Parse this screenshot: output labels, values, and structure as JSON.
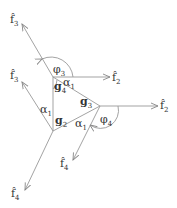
{
  "diagram": {
    "type": "force-vector diagram",
    "line_color": "#888888",
    "text_color": "#333333",
    "nodes": [
      {
        "id": "g4",
        "label": "g",
        "sub": "4",
        "x": 53,
        "y": 77
      },
      {
        "id": "g2",
        "label": "g",
        "sub": "2",
        "x": 53,
        "y": 131
      },
      {
        "id": "g3",
        "label": "g",
        "sub": "3",
        "x": 100,
        "y": 106
      }
    ],
    "vectors": [
      {
        "from": "g4",
        "label": "f̂",
        "sub": "3",
        "to": [
          22,
          24
        ]
      },
      {
        "from": "g4",
        "label": "f̂",
        "sub": "2",
        "to": [
          110,
          77
        ]
      },
      {
        "from": "g2",
        "label": "f̂",
        "sub": "3",
        "to": [
          22,
          82
        ]
      },
      {
        "from": "g2",
        "label": "f̂",
        "sub": "4",
        "to": [
          25,
          190
        ]
      },
      {
        "from": "g3",
        "label": "f̂",
        "sub": "2",
        "to": [
          158,
          106
        ]
      },
      {
        "from": "g3",
        "label": "f̂",
        "sub": "4",
        "to": [
          73,
          160
        ]
      }
    ],
    "edges": [
      [
        "g4",
        "g2"
      ],
      [
        "g4",
        "g3"
      ],
      [
        "g2",
        "g3"
      ]
    ],
    "angles": [
      {
        "label": "φ",
        "sub": "3"
      },
      {
        "label": "α",
        "sub": "1"
      },
      {
        "label": "α",
        "sub": "1"
      },
      {
        "label": "φ",
        "sub": "4"
      },
      {
        "label": "α",
        "sub": "1"
      }
    ]
  },
  "labels": {
    "f3_top": "f̂",
    "f3_top_sub": "3",
    "f2_top": "f̂",
    "f2_top_sub": "2",
    "f3_mid": "f̂",
    "f3_mid_sub": "3",
    "f2_right": "f̂",
    "f2_right_sub": "2",
    "f4_mid": "f̂",
    "f4_mid_sub": "4",
    "f4_bot": "f̂",
    "f4_bot_sub": "4",
    "g4": "g",
    "g4_sub": "4",
    "g3": "g",
    "g3_sub": "3",
    "g2": "g",
    "g2_sub": "2",
    "phi3": "φ",
    "phi3_sub": "3",
    "phi4": "φ",
    "phi4_sub": "4",
    "alpha_top": "α",
    "alpha_top_sub": "1",
    "alpha_left": "α",
    "alpha_left_sub": "1",
    "alpha_right": "α",
    "alpha_right_sub": "1"
  }
}
